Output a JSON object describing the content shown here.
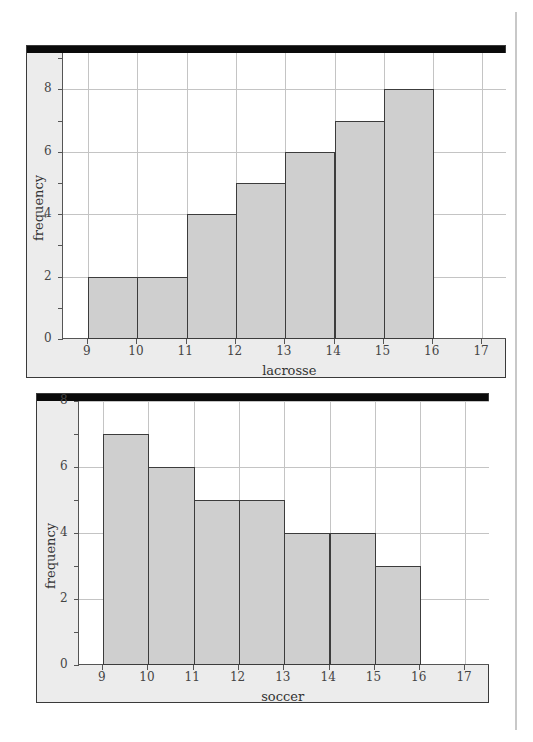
{
  "chart_data": [
    {
      "type": "bar",
      "subtype": "histogram",
      "title": "",
      "xlabel": "lacrosse",
      "ylabel": "frequency",
      "bin_edges": [
        9,
        10,
        11,
        12,
        13,
        14,
        15,
        16
      ],
      "values": [
        2,
        2,
        4,
        5,
        6,
        7,
        8
      ],
      "x_ticks": [
        "9",
        "10",
        "11",
        "12",
        "13",
        "14",
        "15",
        "16",
        "17"
      ],
      "y_ticks": [
        "0",
        "2",
        "4",
        "6",
        "8"
      ],
      "xlim": [
        8.5,
        17.5
      ],
      "ylim": [
        0,
        9.3
      ],
      "grid": true,
      "bar_color": "#cfcfcf"
    },
    {
      "type": "bar",
      "subtype": "histogram",
      "title": "",
      "xlabel": "soccer",
      "ylabel": "frequency",
      "bin_edges": [
        9,
        10,
        11,
        12,
        13,
        14,
        15,
        16
      ],
      "values": [
        7,
        6,
        5,
        5,
        4,
        4,
        3
      ],
      "x_ticks": [
        "9",
        "10",
        "11",
        "12",
        "13",
        "14",
        "15",
        "16",
        "17"
      ],
      "y_ticks": [
        "0",
        "2",
        "4",
        "6",
        "8"
      ],
      "xlim": [
        8.5,
        17.5
      ],
      "ylim": [
        0,
        8
      ],
      "grid": true,
      "bar_color": "#cfcfcf"
    }
  ],
  "charts": [
    {
      "xlabel": "lacrosse",
      "ylabel": "frequency"
    },
    {
      "xlabel": "soccer",
      "ylabel": "frequency"
    }
  ]
}
